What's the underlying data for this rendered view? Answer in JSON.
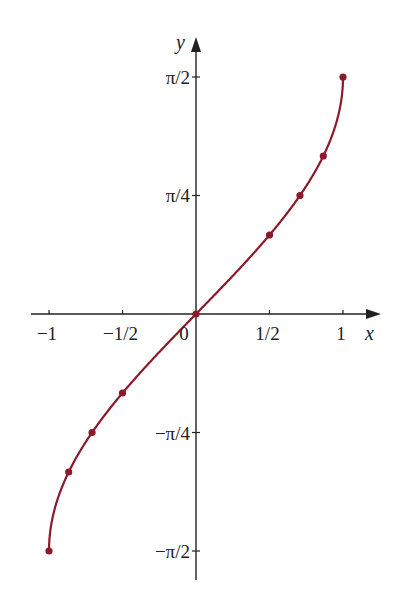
{
  "chart_data": {
    "type": "line",
    "title": "",
    "function": "y = arcsin(x)",
    "xlabel": "x",
    "ylabel": "y",
    "xlim": [
      -1.1,
      1.25
    ],
    "ylim": [
      -1.72,
      1.72
    ],
    "grid": false,
    "legend": null,
    "x_ticks": [
      {
        "value": -1,
        "label": "−1"
      },
      {
        "value": -0.5,
        "label": "−1/2"
      },
      {
        "value": 0,
        "label": "0"
      },
      {
        "value": 0.5,
        "label": "1/2"
      },
      {
        "value": 1,
        "label": "1"
      }
    ],
    "y_ticks": [
      {
        "value": 1.5708,
        "label": "π/2"
      },
      {
        "value": 0.7854,
        "label": "π/4"
      },
      {
        "value": -0.7854,
        "label": "−π/4"
      },
      {
        "value": -1.5708,
        "label": "−π/2"
      }
    ],
    "series": [
      {
        "name": "arcsin(x)",
        "color": "#8b1a2b",
        "marked_points": {
          "x": [
            -1,
            -0.866,
            -0.707,
            -0.5,
            0,
            0.5,
            0.707,
            0.866,
            1
          ],
          "y": [
            -1.5708,
            -1.0472,
            -0.7854,
            -0.5236,
            0,
            0.5236,
            0.7854,
            1.0472,
            1.5708
          ]
        }
      }
    ]
  },
  "colors": {
    "curve": "#8b1a2b",
    "axes": "#222222",
    "background": "#ffffff"
  }
}
